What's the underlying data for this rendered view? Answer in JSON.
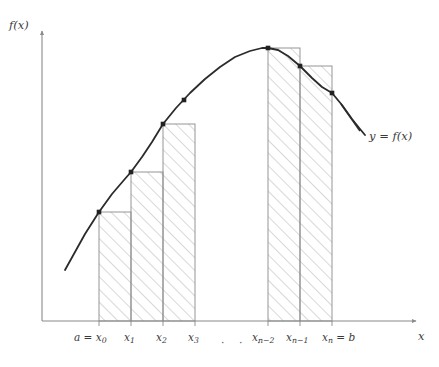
{
  "figure": {
    "axes": {
      "y_label": "f(x)",
      "x_label": "x",
      "origin": [
        42,
        321
      ],
      "x_axis_end": [
        421,
        321
      ],
      "y_axis_top": [
        42,
        27
      ]
    },
    "curve": {
      "label": "y = f(x)",
      "color": "#2b2b2b",
      "width": 1.8,
      "points": [
        [
          65,
          270
        ],
        [
          75,
          252
        ],
        [
          85,
          234
        ],
        [
          99,
          212
        ],
        [
          112,
          194
        ],
        [
          124,
          180
        ],
        [
          131,
          172
        ],
        [
          142,
          157
        ],
        [
          152,
          142
        ],
        [
          163,
          124
        ],
        [
          176,
          108
        ],
        [
          190,
          93
        ],
        [
          205,
          79
        ],
        [
          220,
          67
        ],
        [
          235,
          57
        ],
        [
          250,
          51
        ],
        [
          262,
          48
        ],
        [
          268,
          48
        ],
        [
          278,
          50
        ],
        [
          288,
          56
        ],
        [
          300,
          66
        ],
        [
          312,
          78
        ],
        [
          322,
          87
        ],
        [
          332,
          93
        ],
        [
          342,
          105
        ],
        [
          352,
          119
        ],
        [
          360,
          129
        ],
        [
          365,
          135
        ]
      ]
    },
    "hatch": {
      "color": "#8f8f8f",
      "line_width": 0.7,
      "angle_deg": -45,
      "spacing": 9
    },
    "rect_edge_color": "#8a8a8a",
    "marker": {
      "color": "#222222",
      "size": 4.6,
      "shape": "square"
    },
    "rectangles": [
      {
        "name": "rect-0",
        "x_left": 99,
        "x_right": 131,
        "y_top": 212,
        "y_base": 321
      },
      {
        "name": "rect-1",
        "x_left": 131,
        "x_right": 163,
        "y_top": 172,
        "y_base": 321
      },
      {
        "name": "rect-2",
        "x_left": 163,
        "x_right": 195,
        "y_top": 124,
        "y_base": 321
      },
      {
        "name": "rect-3",
        "x_left": 268,
        "x_right": 300,
        "y_top": 48,
        "y_base": 321
      },
      {
        "name": "rect-4",
        "x_left": 300,
        "x_right": 332,
        "y_top": 66,
        "y_base": 321
      }
    ],
    "markers": [
      {
        "name": "marker-x0",
        "x": 99,
        "y": 212
      },
      {
        "name": "marker-x1",
        "x": 131,
        "y": 172
      },
      {
        "name": "marker-x2",
        "x": 163,
        "y": 124
      },
      {
        "name": "marker-x3",
        "x": 184,
        "y": 100
      },
      {
        "name": "marker-xn-2",
        "x": 268,
        "y": 48
      },
      {
        "name": "marker-xn-1",
        "x": 300,
        "y": 66
      },
      {
        "name": "marker-xn",
        "x": 332,
        "y": 93
      }
    ],
    "tick_marks": [
      99,
      131,
      163,
      195,
      268,
      300,
      332
    ],
    "ellipsis": "· · ·",
    "tick_labels": {
      "x0": {
        "base": "a = x",
        "sub": "0",
        "x": 99
      },
      "x1": {
        "base": "x",
        "sub": "1",
        "x": 131
      },
      "x2": {
        "base": "x",
        "sub": "2",
        "x": 163
      },
      "x3": {
        "base": "x",
        "sub": "3",
        "x": 195
      },
      "xn2": {
        "base": "x",
        "sub": "n−2",
        "x": 268
      },
      "xn1": {
        "base": "x",
        "sub": "n−1",
        "x": 300
      },
      "xn": {
        "base": "x",
        "sub": "n",
        "tail": " = b",
        "x": 332
      }
    }
  }
}
